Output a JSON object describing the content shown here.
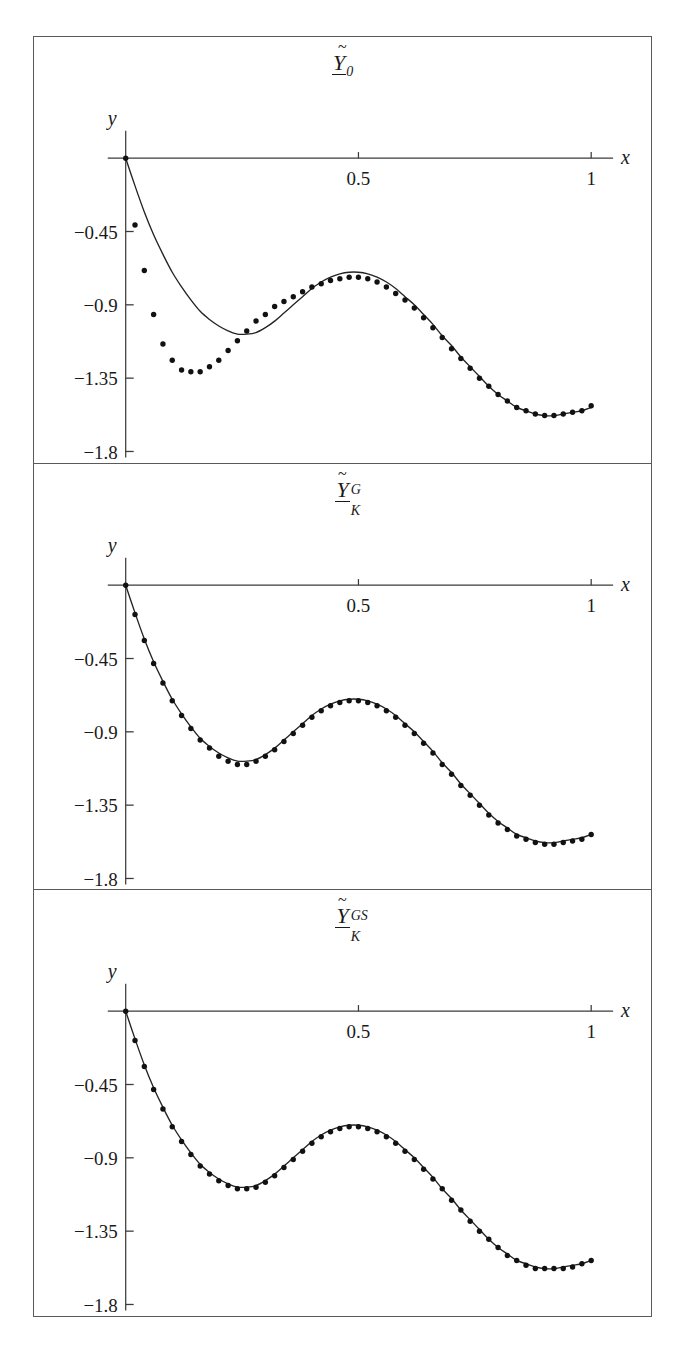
{
  "figure": {
    "background": "#ffffff",
    "frame_color": "#5a5a5a",
    "curve_color": "#232323",
    "dot_color": "#111111",
    "panel_count": 3
  },
  "panels": [
    {
      "title": {
        "base": "Y",
        "accent": "~",
        "underline": true,
        "subscript": "0",
        "superscript": ""
      },
      "axis": {
        "xlabel": "x",
        "ylabel": "y",
        "xticks": [
          "0.5",
          "1"
        ],
        "yticks": [
          "-0.45",
          "-0.9",
          "-1.35",
          "-1.8"
        ]
      }
    },
    {
      "title": {
        "base": "Y",
        "accent": "~",
        "underline": true,
        "subscript": "K",
        "superscript": "G"
      },
      "axis": {
        "xlabel": "x",
        "ylabel": "y",
        "xticks": [
          "0.5",
          "1"
        ],
        "yticks": [
          "-0.45",
          "-0.9",
          "-1.35",
          "-1.8"
        ]
      }
    },
    {
      "title": {
        "base": "Y",
        "accent": "~",
        "underline": true,
        "subscript": "K",
        "superscript": "GS"
      },
      "axis": {
        "xlabel": "x",
        "ylabel": "y",
        "xticks": [
          "0.5",
          "1"
        ],
        "yticks": [
          "-0.45",
          "-0.9",
          "-1.35",
          "-1.8"
        ]
      }
    }
  ],
  "chart_data": [
    {
      "type": "line",
      "title": "Y~_0",
      "xlabel": "x",
      "ylabel": "y",
      "xlim": [
        0,
        1
      ],
      "ylim": [
        -1.8,
        0
      ],
      "xticks": [
        0.5,
        1
      ],
      "yticks": [
        -0.45,
        -0.9,
        -1.35,
        -1.8
      ],
      "grid": false,
      "legend": "none",
      "series": [
        {
          "name": "reference curve",
          "style": "solid-line",
          "x": [
            0.0,
            0.02,
            0.04,
            0.06,
            0.08,
            0.1,
            0.12,
            0.14,
            0.16,
            0.18,
            0.2,
            0.22,
            0.24,
            0.26,
            0.28,
            0.3,
            0.32,
            0.34,
            0.36,
            0.38,
            0.4,
            0.42,
            0.44,
            0.46,
            0.48,
            0.5,
            0.52,
            0.54,
            0.56,
            0.58,
            0.6,
            0.62,
            0.64,
            0.66,
            0.68,
            0.7,
            0.72,
            0.74,
            0.76,
            0.78,
            0.8,
            0.82,
            0.84,
            0.86,
            0.88,
            0.9,
            0.92,
            0.94,
            0.96,
            0.98,
            1.0
          ],
          "y": [
            0.0,
            -0.17,
            -0.33,
            -0.47,
            -0.59,
            -0.7,
            -0.79,
            -0.87,
            -0.94,
            -0.99,
            -1.03,
            -1.06,
            -1.08,
            -1.08,
            -1.07,
            -1.04,
            -1.0,
            -0.95,
            -0.9,
            -0.85,
            -0.8,
            -0.76,
            -0.73,
            -0.71,
            -0.7,
            -0.7,
            -0.71,
            -0.73,
            -0.76,
            -0.8,
            -0.85,
            -0.9,
            -0.96,
            -1.02,
            -1.09,
            -1.15,
            -1.22,
            -1.28,
            -1.34,
            -1.4,
            -1.45,
            -1.49,
            -1.53,
            -1.55,
            -1.57,
            -1.58,
            -1.58,
            -1.57,
            -1.56,
            -1.55,
            -1.53
          ]
        },
        {
          "name": "approximation points",
          "style": "dots",
          "x": [
            0.0,
            0.02,
            0.04,
            0.06,
            0.08,
            0.1,
            0.12,
            0.14,
            0.16,
            0.18,
            0.2,
            0.22,
            0.24,
            0.26,
            0.28,
            0.3,
            0.32,
            0.34,
            0.36,
            0.38,
            0.4,
            0.42,
            0.44,
            0.46,
            0.48,
            0.5,
            0.52,
            0.54,
            0.56,
            0.58,
            0.6,
            0.62,
            0.64,
            0.66,
            0.68,
            0.7,
            0.72,
            0.74,
            0.76,
            0.78,
            0.8,
            0.82,
            0.84,
            0.86,
            0.88,
            0.9,
            0.92,
            0.94,
            0.96,
            0.98,
            1.0
          ],
          "y": [
            0.0,
            -0.41,
            -0.69,
            -0.96,
            -1.14,
            -1.24,
            -1.3,
            -1.31,
            -1.31,
            -1.28,
            -1.24,
            -1.18,
            -1.12,
            -1.06,
            -1.0,
            -0.96,
            -0.91,
            -0.88,
            -0.85,
            -0.82,
            -0.79,
            -0.77,
            -0.75,
            -0.74,
            -0.73,
            -0.73,
            -0.74,
            -0.76,
            -0.79,
            -0.83,
            -0.87,
            -0.92,
            -0.98,
            -1.04,
            -1.1,
            -1.17,
            -1.23,
            -1.29,
            -1.35,
            -1.4,
            -1.45,
            -1.49,
            -1.53,
            -1.55,
            -1.57,
            -1.58,
            -1.58,
            -1.57,
            -1.56,
            -1.55,
            -1.52
          ]
        }
      ]
    },
    {
      "type": "line",
      "title": "Y~_K^G",
      "xlabel": "x",
      "ylabel": "y",
      "xlim": [
        0,
        1
      ],
      "ylim": [
        -1.8,
        0
      ],
      "xticks": [
        0.5,
        1
      ],
      "yticks": [
        -0.45,
        -0.9,
        -1.35,
        -1.8
      ],
      "grid": false,
      "legend": "none",
      "series": [
        {
          "name": "reference curve",
          "style": "solid-line",
          "x": [
            0.0,
            0.02,
            0.04,
            0.06,
            0.08,
            0.1,
            0.12,
            0.14,
            0.16,
            0.18,
            0.2,
            0.22,
            0.24,
            0.26,
            0.28,
            0.3,
            0.32,
            0.34,
            0.36,
            0.38,
            0.4,
            0.42,
            0.44,
            0.46,
            0.48,
            0.5,
            0.52,
            0.54,
            0.56,
            0.58,
            0.6,
            0.62,
            0.64,
            0.66,
            0.68,
            0.7,
            0.72,
            0.74,
            0.76,
            0.78,
            0.8,
            0.82,
            0.84,
            0.86,
            0.88,
            0.9,
            0.92,
            0.94,
            0.96,
            0.98,
            1.0
          ],
          "y": [
            0.0,
            -0.17,
            -0.33,
            -0.47,
            -0.59,
            -0.7,
            -0.79,
            -0.87,
            -0.94,
            -0.99,
            -1.03,
            -1.06,
            -1.08,
            -1.08,
            -1.07,
            -1.04,
            -1.0,
            -0.95,
            -0.9,
            -0.85,
            -0.8,
            -0.76,
            -0.73,
            -0.71,
            -0.7,
            -0.7,
            -0.71,
            -0.73,
            -0.76,
            -0.8,
            -0.85,
            -0.9,
            -0.96,
            -1.02,
            -1.09,
            -1.15,
            -1.22,
            -1.28,
            -1.34,
            -1.4,
            -1.45,
            -1.49,
            -1.53,
            -1.55,
            -1.57,
            -1.58,
            -1.58,
            -1.57,
            -1.56,
            -1.55,
            -1.53
          ]
        },
        {
          "name": "approximation points",
          "style": "dots",
          "x": [
            0.0,
            0.02,
            0.04,
            0.06,
            0.08,
            0.1,
            0.12,
            0.14,
            0.16,
            0.18,
            0.2,
            0.22,
            0.24,
            0.26,
            0.28,
            0.3,
            0.32,
            0.34,
            0.36,
            0.38,
            0.4,
            0.42,
            0.44,
            0.46,
            0.48,
            0.5,
            0.52,
            0.54,
            0.56,
            0.58,
            0.6,
            0.62,
            0.64,
            0.66,
            0.68,
            0.7,
            0.72,
            0.74,
            0.76,
            0.78,
            0.8,
            0.82,
            0.84,
            0.86,
            0.88,
            0.9,
            0.92,
            0.94,
            0.96,
            0.98,
            1.0
          ],
          "y": [
            0.0,
            -0.18,
            -0.34,
            -0.48,
            -0.6,
            -0.71,
            -0.8,
            -0.88,
            -0.95,
            -1.0,
            -1.05,
            -1.08,
            -1.1,
            -1.1,
            -1.08,
            -1.05,
            -1.01,
            -0.96,
            -0.91,
            -0.86,
            -0.81,
            -0.77,
            -0.74,
            -0.72,
            -0.71,
            -0.71,
            -0.72,
            -0.74,
            -0.77,
            -0.81,
            -0.86,
            -0.91,
            -0.97,
            -1.03,
            -1.1,
            -1.16,
            -1.23,
            -1.29,
            -1.35,
            -1.41,
            -1.46,
            -1.5,
            -1.54,
            -1.56,
            -1.58,
            -1.59,
            -1.59,
            -1.58,
            -1.57,
            -1.56,
            -1.53
          ]
        }
      ]
    },
    {
      "type": "line",
      "title": "Y~_K^GS",
      "xlabel": "x",
      "ylabel": "y",
      "xlim": [
        0,
        1
      ],
      "ylim": [
        -1.8,
        0
      ],
      "xticks": [
        0.5,
        1
      ],
      "yticks": [
        -0.45,
        -0.9,
        -1.35,
        -1.8
      ],
      "grid": false,
      "legend": "none",
      "series": [
        {
          "name": "reference curve",
          "style": "solid-line",
          "x": [
            0.0,
            0.02,
            0.04,
            0.06,
            0.08,
            0.1,
            0.12,
            0.14,
            0.16,
            0.18,
            0.2,
            0.22,
            0.24,
            0.26,
            0.28,
            0.3,
            0.32,
            0.34,
            0.36,
            0.38,
            0.4,
            0.42,
            0.44,
            0.46,
            0.48,
            0.5,
            0.52,
            0.54,
            0.56,
            0.58,
            0.6,
            0.62,
            0.64,
            0.66,
            0.68,
            0.7,
            0.72,
            0.74,
            0.76,
            0.78,
            0.8,
            0.82,
            0.84,
            0.86,
            0.88,
            0.9,
            0.92,
            0.94,
            0.96,
            0.98,
            1.0
          ],
          "y": [
            0.0,
            -0.17,
            -0.33,
            -0.47,
            -0.59,
            -0.7,
            -0.79,
            -0.87,
            -0.94,
            -0.99,
            -1.03,
            -1.06,
            -1.08,
            -1.08,
            -1.07,
            -1.04,
            -1.0,
            -0.95,
            -0.9,
            -0.85,
            -0.8,
            -0.76,
            -0.73,
            -0.71,
            -0.7,
            -0.7,
            -0.71,
            -0.73,
            -0.76,
            -0.8,
            -0.85,
            -0.9,
            -0.96,
            -1.02,
            -1.09,
            -1.15,
            -1.22,
            -1.28,
            -1.34,
            -1.4,
            -1.45,
            -1.49,
            -1.53,
            -1.55,
            -1.57,
            -1.58,
            -1.58,
            -1.57,
            -1.56,
            -1.55,
            -1.53
          ]
        },
        {
          "name": "approximation points",
          "style": "dots",
          "x": [
            0.0,
            0.02,
            0.04,
            0.06,
            0.08,
            0.1,
            0.12,
            0.14,
            0.16,
            0.18,
            0.2,
            0.22,
            0.24,
            0.26,
            0.28,
            0.3,
            0.32,
            0.34,
            0.36,
            0.38,
            0.4,
            0.42,
            0.44,
            0.46,
            0.48,
            0.5,
            0.52,
            0.54,
            0.56,
            0.58,
            0.6,
            0.62,
            0.64,
            0.66,
            0.68,
            0.7,
            0.72,
            0.74,
            0.76,
            0.78,
            0.8,
            0.82,
            0.84,
            0.86,
            0.88,
            0.9,
            0.92,
            0.94,
            0.96,
            0.98,
            1.0
          ],
          "y": [
            0.0,
            -0.18,
            -0.34,
            -0.48,
            -0.6,
            -0.71,
            -0.8,
            -0.88,
            -0.95,
            -1.0,
            -1.04,
            -1.07,
            -1.09,
            -1.09,
            -1.08,
            -1.05,
            -1.01,
            -0.96,
            -0.91,
            -0.86,
            -0.81,
            -0.77,
            -0.74,
            -0.72,
            -0.71,
            -0.71,
            -0.72,
            -0.74,
            -0.77,
            -0.81,
            -0.86,
            -0.91,
            -0.97,
            -1.03,
            -1.09,
            -1.16,
            -1.22,
            -1.29,
            -1.35,
            -1.4,
            -1.45,
            -1.5,
            -1.53,
            -1.56,
            -1.58,
            -1.58,
            -1.58,
            -1.58,
            -1.57,
            -1.55,
            -1.53
          ]
        }
      ]
    }
  ]
}
